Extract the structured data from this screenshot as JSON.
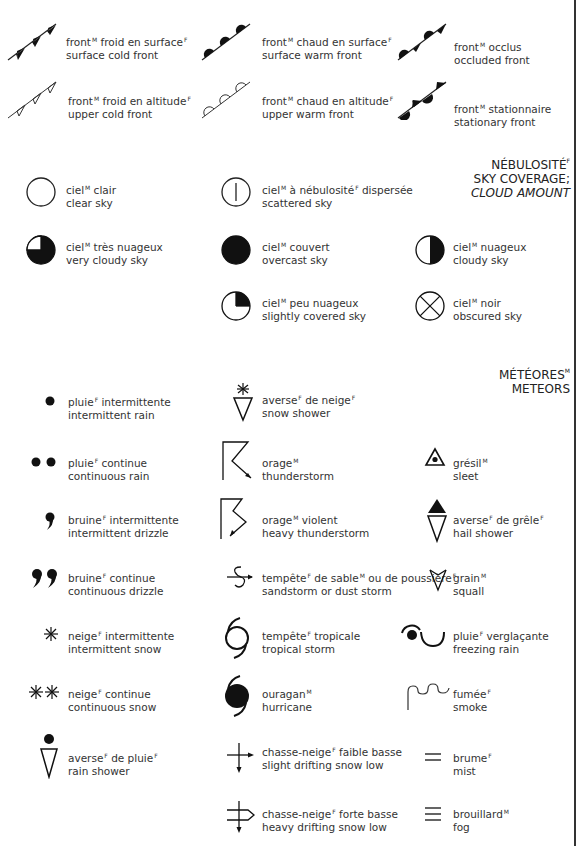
{
  "sections": {
    "fronts": {
      "items": [
        {
          "fr": "front",
          "fr_g": "M",
          "fr2": " froid en surface",
          "fr2_g": "F",
          "en": "surface cold front"
        },
        {
          "fr": "front",
          "fr_g": "M",
          "fr2": " chaud en surface",
          "fr2_g": "F",
          "en": "surface warm front"
        },
        {
          "fr": "front",
          "fr_g": "M",
          "fr2": " occlus",
          "fr2_g": "",
          "en": "occluded front"
        },
        {
          "fr": "front",
          "fr_g": "M",
          "fr2": " froid en altitude",
          "fr2_g": "F",
          "en": "upper cold front"
        },
        {
          "fr": "front",
          "fr_g": "M",
          "fr2": " chaud en altitude",
          "fr2_g": "F",
          "en": "upper warm front"
        },
        {
          "fr": "front",
          "fr_g": "M",
          "fr2": " stationnaire",
          "fr2_g": "",
          "en": "stationary front"
        }
      ]
    },
    "sky": {
      "header": {
        "line1": "NÉBULOSITÉ",
        "line1_g": "F",
        "line2": "SKY COVERAGE;",
        "line3": "CLOUD AMOUNT"
      },
      "items": [
        {
          "fr": "ciel",
          "fr_g": "M",
          "fr2": " clair",
          "fr2_g": "",
          "en": "clear sky"
        },
        {
          "fr": "ciel",
          "fr_g": "M",
          "fr2": " à nébulosité",
          "fr2_g": "F",
          "fr3": " dispersée",
          "en": "scattered sky"
        },
        {
          "fr": "ciel",
          "fr_g": "M",
          "fr2": " très nuageux",
          "fr2_g": "",
          "en": "very cloudy sky"
        },
        {
          "fr": "ciel",
          "fr_g": "M",
          "fr2": " couvert",
          "fr2_g": "",
          "en": "overcast sky"
        },
        {
          "fr": "ciel",
          "fr_g": "M",
          "fr2": " nuageux",
          "fr2_g": "",
          "en": "cloudy sky"
        },
        {
          "fr": "ciel",
          "fr_g": "M",
          "fr2": " peu nuageux",
          "fr2_g": "",
          "en": "slightly covered sky"
        },
        {
          "fr": "ciel",
          "fr_g": "M",
          "fr2": " noir",
          "fr2_g": "",
          "en": "obscured sky"
        }
      ]
    },
    "meteors": {
      "header": {
        "line1": "MÉTÉORES",
        "line1_g": "M",
        "line2": "METEORS"
      },
      "items": [
        {
          "fr": "pluie",
          "fr_g": "F",
          "fr2": " intermittente",
          "fr2_g": "",
          "en": "intermittent rain"
        },
        {
          "fr": "averse",
          "fr_g": "F",
          "fr2": " de neige",
          "fr2_g": "F",
          "en": "snow shower"
        },
        {
          "fr": "pluie",
          "fr_g": "F",
          "fr2": " continue",
          "fr2_g": "",
          "en": "continuous rain"
        },
        {
          "fr": "orage",
          "fr_g": "M",
          "fr2": "",
          "fr2_g": "",
          "en": "thunderstorm"
        },
        {
          "fr": "grésil",
          "fr_g": "M",
          "fr2": "",
          "fr2_g": "",
          "en": "sleet"
        },
        {
          "fr": "bruine",
          "fr_g": "F",
          "fr2": " intermittente",
          "fr2_g": "",
          "en": "intermittent drizzle"
        },
        {
          "fr": "orage",
          "fr_g": "M",
          "fr2": " violent",
          "fr2_g": "",
          "en": "heavy thunderstorm"
        },
        {
          "fr": "averse",
          "fr_g": "F",
          "fr2": " de grêle",
          "fr2_g": "F",
          "en": "hail shower"
        },
        {
          "fr": "bruine",
          "fr_g": "F",
          "fr2": " continue",
          "fr2_g": "",
          "en": "continuous drizzle"
        },
        {
          "fr": "tempête",
          "fr_g": "F",
          "fr2": " de sable",
          "fr2_g": "M",
          "fr3": " ou de poussière",
          "fr3_g": "F",
          "en": "sandstorm or dust storm"
        },
        {
          "fr": "grain",
          "fr_g": "M",
          "fr2": "",
          "fr2_g": "",
          "en": "squall"
        },
        {
          "fr": "neige",
          "fr_g": "F",
          "fr2": " intermittente",
          "fr2_g": "",
          "en": "intermittent snow"
        },
        {
          "fr": "tempête",
          "fr_g": "F",
          "fr2": " tropicale",
          "fr2_g": "",
          "en": "tropical storm"
        },
        {
          "fr": "pluie",
          "fr_g": "F",
          "fr2": " verglaçante",
          "fr2_g": "",
          "en": "freezing rain"
        },
        {
          "fr": "neige",
          "fr_g": "F",
          "fr2": " continue",
          "fr2_g": "",
          "en": "continuous snow"
        },
        {
          "fr": "ouragan",
          "fr_g": "M",
          "fr2": "",
          "fr2_g": "",
          "en": "hurricane"
        },
        {
          "fr": "fumée",
          "fr_g": "F",
          "fr2": "",
          "fr2_g": "",
          "en": "smoke"
        },
        {
          "fr": "averse",
          "fr_g": "F",
          "fr2": " de pluie",
          "fr2_g": "F",
          "en": "rain shower"
        },
        {
          "fr": "chasse-neige",
          "fr_g": "F",
          "fr2": " faible basse",
          "fr2_g": "",
          "en": "slight drifting snow low"
        },
        {
          "fr": "brume",
          "fr_g": "F",
          "fr2": "",
          "fr2_g": "",
          "en": "mist"
        },
        {
          "fr": "chasse-neige",
          "fr_g": "F",
          "fr2": " forte basse",
          "fr2_g": "",
          "en": "heavy drifting snow low"
        },
        {
          "fr": "brouillard",
          "fr_g": "M",
          "fr2": "",
          "fr2_g": "",
          "en": "fog"
        }
      ]
    }
  }
}
